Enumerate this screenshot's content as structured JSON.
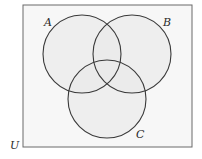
{
  "diagram": {
    "type": "venn",
    "universe": {
      "label": "U",
      "rect": {
        "x": 23,
        "y": 5,
        "width": 169,
        "height": 142
      },
      "fill": "#f7f7f7",
      "stroke": "#6a6a6a"
    },
    "sets": [
      {
        "label": "A",
        "cx": 82,
        "cy": 54,
        "r": 39,
        "label_x": 44,
        "label_y": 26
      },
      {
        "label": "B",
        "cx": 132,
        "cy": 54,
        "r": 39,
        "label_x": 164,
        "label_y": 26
      },
      {
        "label": "C",
        "cx": 107,
        "cy": 99,
        "r": 39,
        "label_x": 136,
        "label_y": 138
      }
    ],
    "circle_fill": "#e9e9e9",
    "circle_stroke": "#3a3a3a"
  }
}
